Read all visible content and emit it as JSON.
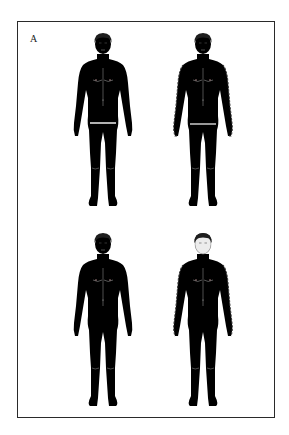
{
  "panel": {
    "label": "A"
  },
  "figures": [
    {
      "id": "top-left",
      "position": "top-left",
      "fill": "#ececec",
      "marking": "waist-band",
      "marking_color": "#ffffff"
    },
    {
      "id": "top-right",
      "position": "top-right",
      "fill": "#ececec",
      "marking": "arm-dashed-outline-plus-waist-band",
      "marking_color": "#3a3a3a"
    },
    {
      "id": "bottom-left",
      "position": "bottom-left",
      "fill": "#ededed",
      "marking": "none"
    },
    {
      "id": "bottom-right",
      "position": "bottom-right",
      "fill": "#8e8e8e",
      "marking": "arm-dashed-outline-shaded-body",
      "marking_color": "#3a3a3a"
    }
  ],
  "colors": {
    "frame": "#2a2a2a",
    "hair": "#1e1e1e",
    "outline": "#9a9a9a",
    "background": "#ffffff"
  }
}
